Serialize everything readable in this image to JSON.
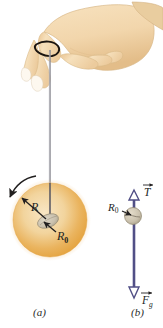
{
  "figure": {
    "type": "physics-diagram",
    "panels": [
      {
        "id": "a",
        "caption": "(a)",
        "description": "Hand holding a yo-yo by a string; yo-yo disk spinning",
        "labels": [
          {
            "name": "radius-outer",
            "text": "R"
          },
          {
            "name": "radius-axle",
            "text": "R0",
            "base": "R",
            "subscript": "0"
          }
        ],
        "rotation_arrow": "counterclockwise"
      },
      {
        "id": "b",
        "caption": "(b)",
        "description": "Free-body diagram of the yo-yo with tension and gravity",
        "labels": [
          {
            "name": "radius-axle",
            "text": "R0",
            "base": "R",
            "subscript": "0"
          }
        ],
        "vectors": [
          {
            "name": "tension",
            "symbol": "T",
            "subscript": "",
            "direction": "up",
            "arrow": "hollow"
          },
          {
            "name": "gravity",
            "symbol": "F",
            "subscript": "g",
            "direction": "down",
            "arrow": "hollow"
          }
        ]
      }
    ]
  },
  "colors": {
    "disk_center": "#f4d9a8",
    "disk_edge": "#e8a64a",
    "axle": "#cfc6b2",
    "skin": "#f5dcb4",
    "skin_shadow": "#e2bc86",
    "nail": "#fbf4ea",
    "string": "#8a8a92",
    "vector": "#514f86",
    "text": "#2a2a2a"
  }
}
